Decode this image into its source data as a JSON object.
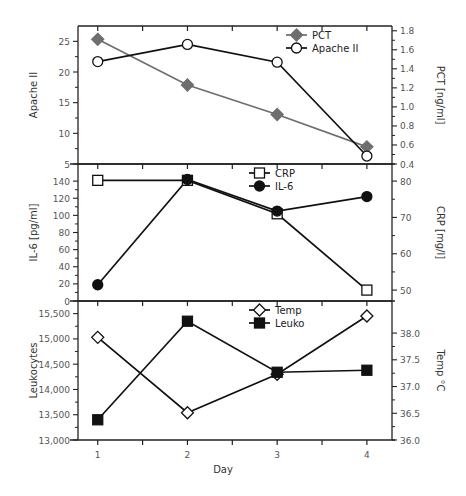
{
  "chart_data": [
    {
      "type": "line",
      "panel": "top",
      "x": [
        1,
        2,
        3,
        4
      ],
      "left_axis": {
        "label": "Apache II",
        "ylim": [
          5,
          27.5
        ],
        "ticks": [
          5,
          10,
          15,
          20,
          25
        ],
        "tick_labels": [
          "5",
          "10",
          "15",
          "20",
          "25"
        ]
      },
      "right_axis": {
        "label": "PCT [ng/ml]",
        "ylim": [
          0.4,
          1.85
        ],
        "ticks": [
          0.4,
          0.6,
          0.8,
          1.0,
          1.2,
          1.4,
          1.6,
          1.8
        ],
        "tick_labels": [
          "0.4",
          "0.6",
          "0.8",
          "1.0",
          "1.2",
          "1.4",
          "1.6",
          "1.8"
        ]
      },
      "series": [
        {
          "name": "PCT",
          "axis": "right",
          "marker": "diamond-filled",
          "color": "#6e6e6e",
          "values": [
            1.71,
            1.23,
            0.92,
            0.58
          ]
        },
        {
          "name": "Apache II",
          "axis": "left",
          "marker": "circle-open",
          "color": "#111111",
          "values": [
            21.7,
            24.5,
            21.6,
            6.3
          ]
        }
      ],
      "legend": {
        "placement": "top-right",
        "entries": [
          "PCT",
          "Apache II"
        ]
      }
    },
    {
      "type": "line",
      "panel": "middle",
      "x": [
        1,
        2,
        3,
        4
      ],
      "left_axis": {
        "label": "IL-6 [pg/ml]",
        "ylim": [
          0,
          160
        ],
        "ticks": [
          0,
          20,
          40,
          60,
          80,
          100,
          120,
          140
        ],
        "tick_labels": [
          "0",
          "20",
          "40",
          "60",
          "80",
          "100",
          "120",
          "140"
        ]
      },
      "right_axis": {
        "label": "CRP [mg/l]",
        "ylim": [
          47,
          84.7
        ],
        "ticks": [
          50,
          60,
          70,
          80
        ],
        "tick_labels": [
          "50",
          "60",
          "70",
          "80"
        ]
      },
      "series": [
        {
          "name": "CRP",
          "axis": "right",
          "marker": "square-open",
          "color": "#111111",
          "values": [
            80.2,
            80.2,
            71,
            50
          ]
        },
        {
          "name": "IL-6",
          "axis": "left",
          "marker": "circle-filled",
          "color": "#111111",
          "values": [
            19,
            142,
            105,
            122
          ]
        }
      ],
      "legend": {
        "placement": "top-center",
        "entries": [
          "CRP",
          "IL-6"
        ]
      }
    },
    {
      "type": "line",
      "panel": "bottom",
      "x": [
        1,
        2,
        3,
        4
      ],
      "xlabel": "Day",
      "x_ticks": [
        1,
        2,
        3,
        4
      ],
      "x_tick_labels": [
        "1",
        "2",
        "3",
        "4"
      ],
      "xlim": [
        0.78,
        4.28
      ],
      "left_axis": {
        "label": "Leukocytes",
        "ylim": [
          13000,
          15750
        ],
        "ticks": [
          13000,
          13500,
          14000,
          14500,
          15000,
          15500
        ],
        "tick_labels": [
          "13,000",
          "13,500",
          "14,000",
          "14,500",
          "15,000",
          "15,500"
        ]
      },
      "right_axis": {
        "label": "Temp °C",
        "ylim": [
          36.0,
          38.6
        ],
        "ticks": [
          36.0,
          36.5,
          37.0,
          37.5,
          38.0
        ],
        "tick_labels": [
          "36.0",
          "36.5",
          "37.0",
          "37.5",
          "38.0"
        ]
      },
      "series": [
        {
          "name": "Temp",
          "axis": "right",
          "marker": "diamond-open",
          "color": "#111111",
          "values": [
            37.92,
            36.51,
            37.23,
            38.32
          ]
        },
        {
          "name": "Leuko",
          "axis": "left",
          "marker": "square-filled",
          "color": "#111111",
          "values": [
            13400,
            15350,
            14340,
            14380
          ]
        }
      ],
      "legend": {
        "placement": "top-center",
        "entries": [
          "Temp",
          "Leuko"
        ]
      }
    }
  ]
}
